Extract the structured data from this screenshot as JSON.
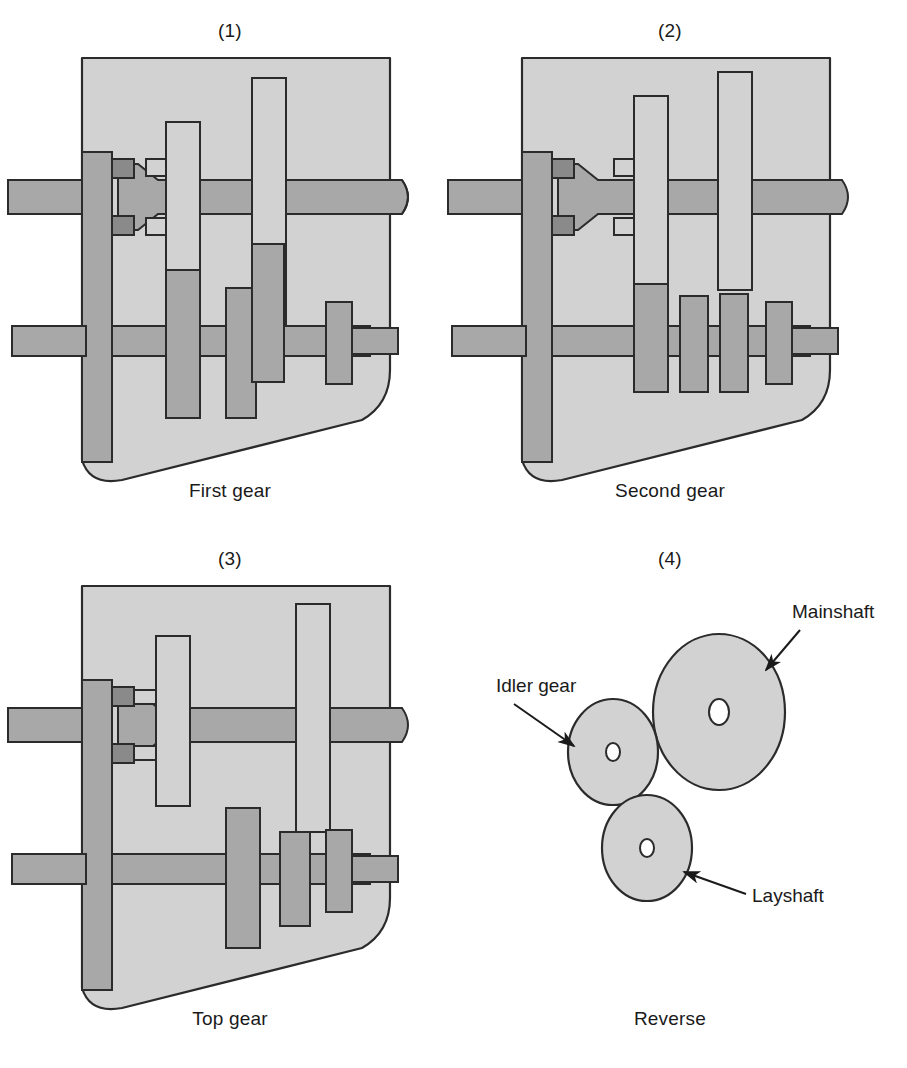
{
  "figure": {
    "background": "#ffffff"
  },
  "colors": {
    "casing_fill": "#d2d2d2",
    "casing_stroke": "#2b2b2b",
    "shaft_fill": "#a8a8a8",
    "shaft_stroke": "#2b2b2b",
    "gear_fixed_fill": "#a8a8a8",
    "gear_sliding_fill": "#d2d2d2",
    "selector_fill": "#8a8a8a",
    "text": "#1a1a1a"
  },
  "panels": [
    {
      "number": "(1)",
      "caption": "First gear",
      "type": "section",
      "sliding_gear_positions": {
        "upper": 188,
        "lower": 268
      },
      "engaged": "lower"
    },
    {
      "number": "(2)",
      "caption": "Second gear",
      "type": "section",
      "sliding_gear_positions": {
        "upper": 160,
        "lower": 240
      },
      "engaged": "upper"
    },
    {
      "number": "(3)",
      "caption": "Top gear",
      "type": "section",
      "sliding_gear_positions": {
        "upper": 120,
        "lower": 215
      },
      "engaged": "none"
    },
    {
      "number": "(4)",
      "caption": "Reverse",
      "type": "reverse"
    }
  ],
  "reverse": {
    "labels": [
      {
        "id": "mainshaft",
        "text": "Mainshaft"
      },
      {
        "id": "idler-gear",
        "text": "Idler gear"
      },
      {
        "id": "layshaft",
        "text": "Layshaft"
      }
    ],
    "gears": [
      {
        "id": "mainshaft-gear",
        "rx": 66,
        "ry": 78,
        "cx": 249,
        "cy": 132,
        "hole_rx": 10,
        "hole_ry": 13
      },
      {
        "id": "idler-gear-circle",
        "rx": 45,
        "ry": 53,
        "cx": 143,
        "cy": 172,
        "hole_rx": 7,
        "hole_ry": 9
      },
      {
        "id": "layshaft-gear",
        "rx": 45,
        "ry": 53,
        "cx": 177,
        "cy": 268,
        "hole_rx": 7,
        "hole_ry": 9
      }
    ]
  }
}
